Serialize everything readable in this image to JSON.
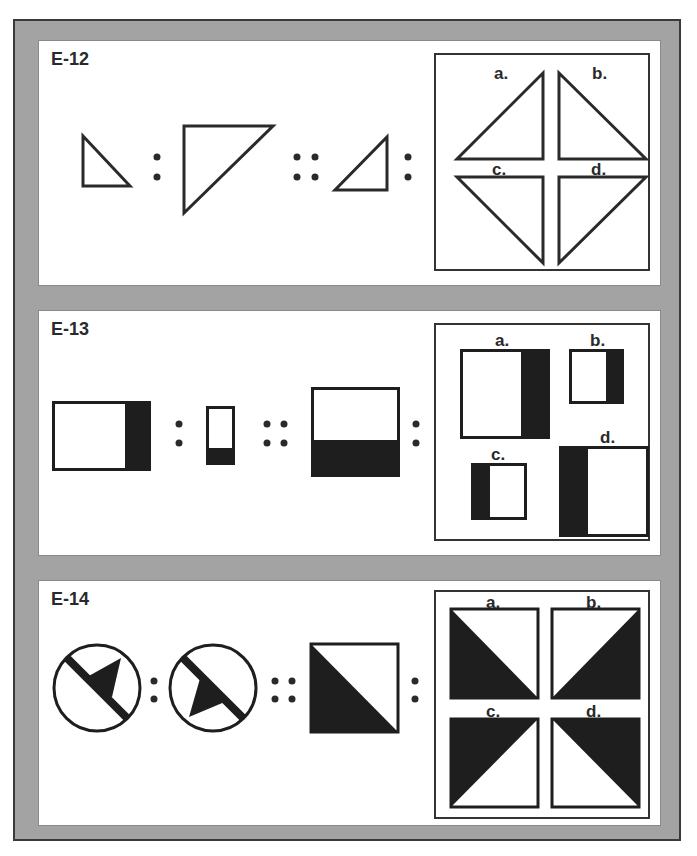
{
  "page": {
    "frame_color": "#a3a3a3",
    "ink_color": "#1e1e1e"
  },
  "problems": [
    {
      "id": "E-12",
      "label": "E-12",
      "analogy": [
        "small right triangle (right angle bottom-left)",
        "large right triangle (right angle top-left)",
        "small right triangle (right angle bottom-right)",
        "?"
      ],
      "options": [
        {
          "label": "a.",
          "desc": "right triangle, right angle bottom-right"
        },
        {
          "label": "b.",
          "desc": "right triangle, right angle bottom-left"
        },
        {
          "label": "c.",
          "desc": "right triangle, right angle top-right"
        },
        {
          "label": "d.",
          "desc": "right triangle, right angle top-left"
        }
      ]
    },
    {
      "id": "E-13",
      "label": "E-13",
      "analogy": [
        "wide rectangle, black right band",
        "small tall rectangle, black bottom band",
        "large rectangle, black bottom half",
        "?"
      ],
      "options": [
        {
          "label": "a.",
          "desc": "large rectangle, black right band"
        },
        {
          "label": "b.",
          "desc": "small rectangle, black right band"
        },
        {
          "label": "c.",
          "desc": "small rectangle, black left band"
        },
        {
          "label": "d.",
          "desc": "large rectangle, black left band"
        }
      ]
    },
    {
      "id": "E-14",
      "label": "E-14",
      "analogy": [
        "circle with diagonal bar and black flag up-right",
        "circle with diagonal bar and black flag down-left",
        "square with black lower-left triangle",
        "?"
      ],
      "options": [
        {
          "label": "a.",
          "desc": "square, black lower-left triangle"
        },
        {
          "label": "b.",
          "desc": "square, black lower-right triangle"
        },
        {
          "label": "c.",
          "desc": "square, black upper-left triangle"
        },
        {
          "label": "d.",
          "desc": "square, black upper-right triangle"
        }
      ]
    }
  ]
}
